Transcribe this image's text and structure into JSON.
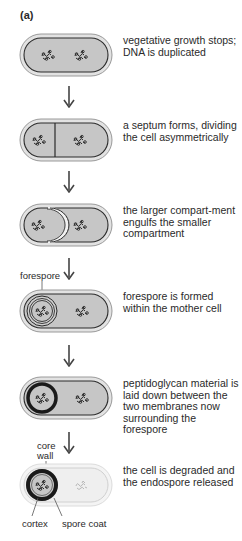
{
  "figure": {
    "panel_label": "(a)",
    "colors": {
      "cytoplasm": "#c6c6c6",
      "membrane": "#2b2b2b",
      "wall": "#e2e2e2",
      "degraded_cell": "#ededed",
      "spore_coat": "#1a1a1a"
    },
    "dna_icon": "dna-squiggle",
    "steps": [
      {
        "id": 1,
        "text": "vegetative growth stops; DNA is duplicated"
      },
      {
        "id": 2,
        "text": "a septum forms, dividing the cell asymmetrically"
      },
      {
        "id": 3,
        "text": "the larger compart-ment engulfs the smaller compartment"
      },
      {
        "id": 4,
        "text": "forespore is formed within the mother cell"
      },
      {
        "id": 5,
        "text": "peptidoglycan material is laid down between the two membranes now surrounding the forespore"
      },
      {
        "id": 6,
        "text": "the cell is degraded and the endospore released"
      }
    ],
    "labels": {
      "forespore": "forespore",
      "core": "core",
      "wall": "wall",
      "cortex": "cortex",
      "spore_coat": "spore coat"
    }
  }
}
